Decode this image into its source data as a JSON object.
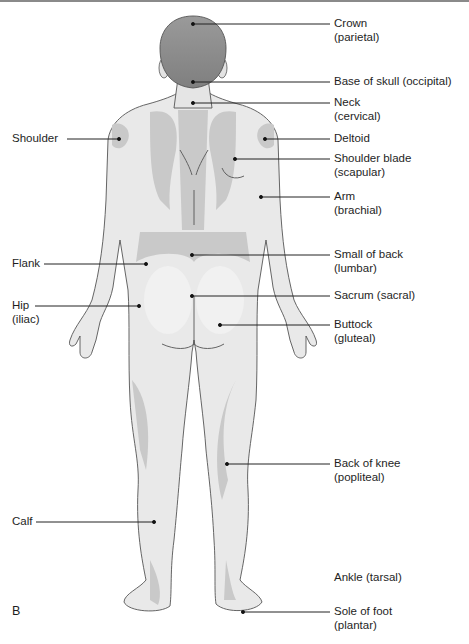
{
  "figure": {
    "panel_letter": "B",
    "view": "posterior",
    "colors": {
      "skin_light": "#e9e9e9",
      "skin_shade": "#c9c9c9",
      "hair": "#8f8f8f",
      "outline": "#555555",
      "leader_line": "#222222"
    }
  },
  "labels": {
    "left": [
      {
        "id": "shoulder",
        "line1": "Shoulder",
        "line2": ""
      },
      {
        "id": "flank",
        "line1": "Flank",
        "line2": ""
      },
      {
        "id": "hip",
        "line1": "Hip",
        "line2": "(iliac)"
      },
      {
        "id": "calf",
        "line1": "Calf",
        "line2": ""
      }
    ],
    "right": [
      {
        "id": "crown",
        "line1": "Crown",
        "line2": "(parietal)"
      },
      {
        "id": "base-of-skull",
        "line1": "Base of skull (occipital)",
        "line2": ""
      },
      {
        "id": "neck",
        "line1": "Neck",
        "line2": "(cervical)"
      },
      {
        "id": "deltoid",
        "line1": "Deltoid",
        "line2": ""
      },
      {
        "id": "shoulder-blade",
        "line1": "Shoulder blade",
        "line2": "(scapular)"
      },
      {
        "id": "arm",
        "line1": "Arm",
        "line2": "(brachial)"
      },
      {
        "id": "small-of-back",
        "line1": "Small of back",
        "line2": "(lumbar)"
      },
      {
        "id": "sacrum",
        "line1": "Sacrum (sacral)",
        "line2": ""
      },
      {
        "id": "buttock",
        "line1": "Buttock",
        "line2": "(gluteal)"
      },
      {
        "id": "back-of-knee",
        "line1": "Back of knee",
        "line2": "(popliteal)"
      },
      {
        "id": "ankle",
        "line1": "Ankle (tarsal)",
        "line2": ""
      },
      {
        "id": "sole-of-foot",
        "line1": "Sole of foot",
        "line2": "(plantar)"
      }
    ]
  }
}
